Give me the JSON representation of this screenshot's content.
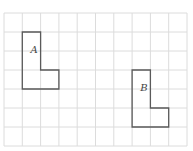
{
  "diagram": {
    "grid": {
      "columns": 10,
      "rows": 7,
      "x0": 4,
      "y0": 13,
      "cell_w": 18.3,
      "cell_h": 19,
      "line_color": "#dcdcdc"
    },
    "shapes": [
      {
        "label": "A",
        "cells_outline": [
          [
            1,
            1
          ],
          [
            2,
            1
          ],
          [
            2,
            3
          ],
          [
            3,
            3
          ],
          [
            3,
            4
          ],
          [
            1,
            4
          ]
        ],
        "label_pos": [
          1.45,
          2.1
        ]
      },
      {
        "label": "B",
        "cells_outline": [
          [
            7,
            3
          ],
          [
            8,
            3
          ],
          [
            8,
            5
          ],
          [
            9,
            5
          ],
          [
            9,
            6
          ],
          [
            7,
            6
          ]
        ],
        "label_pos": [
          7.45,
          4.1
        ]
      }
    ],
    "outline_color": "#5a5a5a"
  }
}
